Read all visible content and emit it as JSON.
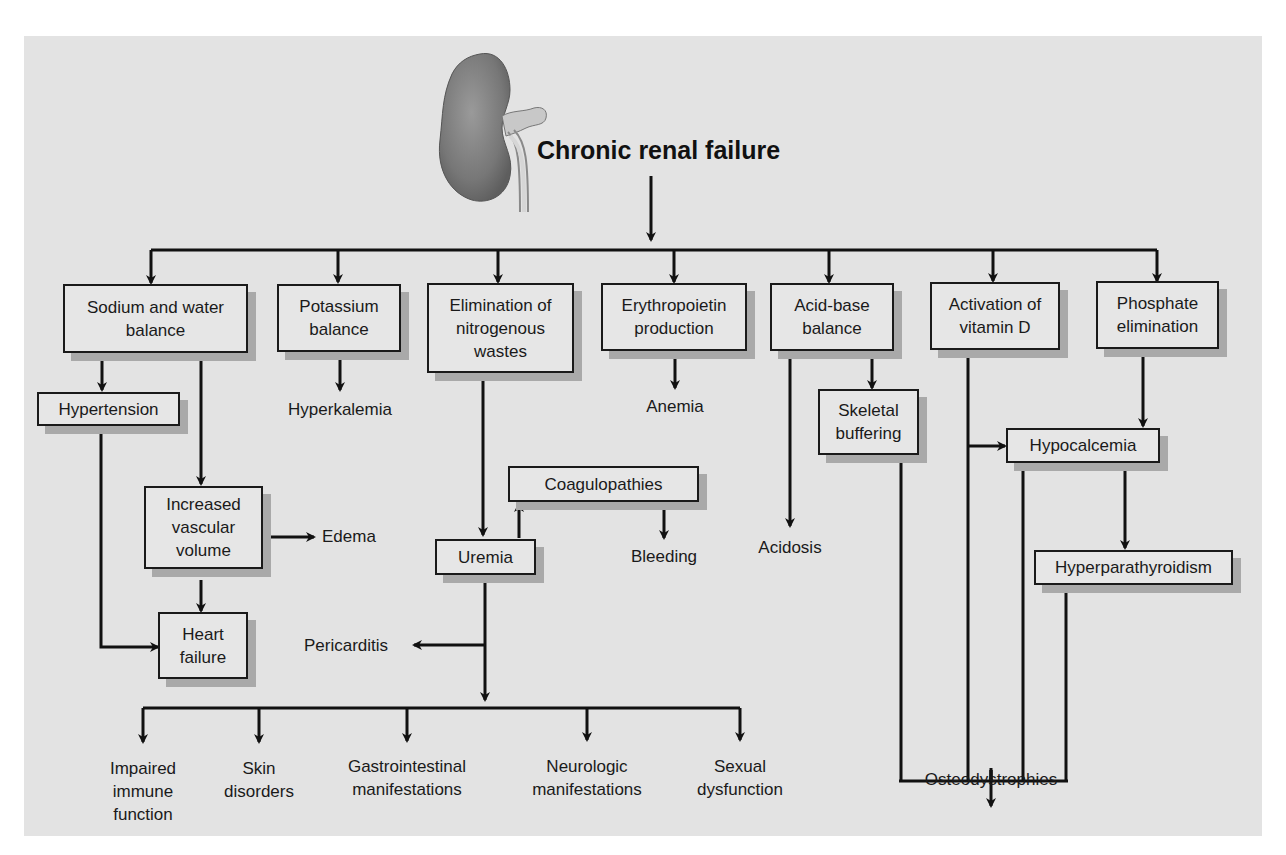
{
  "title": "Chronic renal failure",
  "illustration": "kidney-illustration",
  "colors": {
    "panel_background": "#e3e3e3",
    "box_fill": "#e6e6e6",
    "box_border": "#1a1a1a",
    "box_shadow": "#a9a9a9",
    "arrow": "#111111"
  },
  "functions": [
    {
      "id": "sodium",
      "label": "Sodium and water balance"
    },
    {
      "id": "potassium",
      "label": "Potassium balance"
    },
    {
      "id": "nitrogen",
      "label": "Elimination of nitrogenous wastes"
    },
    {
      "id": "epo",
      "label": "Erythropoietin production"
    },
    {
      "id": "acidbase",
      "label": "Acid-base balance"
    },
    {
      "id": "vitd",
      "label": "Activation of vitamin D"
    },
    {
      "id": "phosphate",
      "label": "Phosphate elimination"
    }
  ],
  "boxes": {
    "sodium_l1": "Sodium and water",
    "sodium_l2": "balance",
    "potassium_l1": "Potassium",
    "potassium_l2": "balance",
    "nitrogen_l1": "Elimination of",
    "nitrogen_l2": "nitrogenous",
    "nitrogen_l3": "wastes",
    "epo_l1": "Erythropoietin",
    "epo_l2": "production",
    "acidbase_l1": "Acid-base",
    "acidbase_l2": "balance",
    "vitd_l1": "Activation of",
    "vitd_l2": "vitamin D",
    "phosphate_l1": "Phosphate",
    "phosphate_l2": "elimination",
    "hypertension": "Hypertension",
    "vascular_l1": "Increased",
    "vascular_l2": "vascular",
    "vascular_l3": "volume",
    "heart_l1": "Heart",
    "heart_l2": "failure",
    "uremia": "Uremia",
    "coagulopathies": "Coagulopathies",
    "skeletal_l1": "Skeletal",
    "skeletal_l2": "buffering",
    "hypocalcemia": "Hypocalcemia",
    "hyperparathyroidism": "Hyperparathyroidism"
  },
  "outcomes": {
    "hyperkalemia": "Hyperkalemia",
    "anemia": "Anemia",
    "edema": "Edema",
    "bleeding": "Bleeding",
    "acidosis": "Acidosis",
    "pericarditis": "Pericarditis",
    "osteodystrophies": "Osteodystrophies",
    "immune_l1": "Impaired",
    "immune_l2": "immune",
    "immune_l3": "function",
    "skin_l1": "Skin",
    "skin_l2": "disorders",
    "gi_l1": "Gastrointestinal",
    "gi_l2": "manifestations",
    "neuro_l1": "Neurologic",
    "neuro_l2": "manifestations",
    "sexual_l1": "Sexual",
    "sexual_l2": "dysfunction"
  }
}
